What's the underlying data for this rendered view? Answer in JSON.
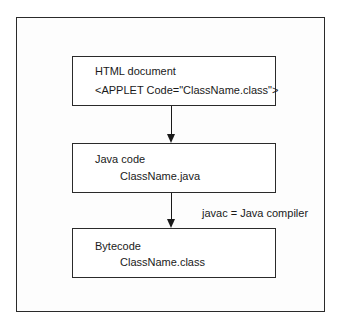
{
  "diagram": {
    "type": "flowchart",
    "nodes": [
      {
        "id": "html",
        "title": "HTML document",
        "detail": "<APPLET Code=\"ClassName.class\">"
      },
      {
        "id": "java",
        "title": "Java code",
        "detail": "ClassName.java"
      },
      {
        "id": "bytecode",
        "title": "Bytecode",
        "detail": "ClassName.class"
      }
    ],
    "edges": [
      {
        "from": "html",
        "to": "java",
        "label": ""
      },
      {
        "from": "java",
        "to": "bytecode",
        "label": "javac = Java compiler"
      }
    ]
  },
  "colors": {
    "stroke": "#2a2a2a",
    "text": "#1a1a1a",
    "background": "#ffffff"
  }
}
